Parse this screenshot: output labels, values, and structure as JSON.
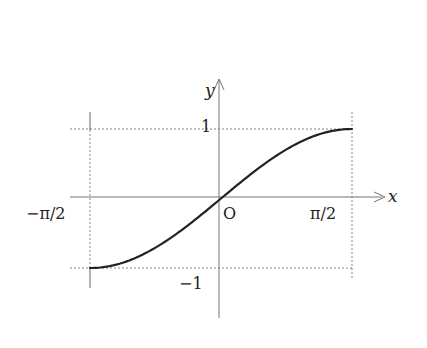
{
  "chart_data": {
    "type": "line",
    "title": "",
    "function": "y = sin x",
    "xlabel": "x",
    "ylabel": "y",
    "xlim": [
      -1.5708,
      1.5708
    ],
    "ylim": [
      -1,
      1
    ],
    "x_ticks": [
      {
        "value": -1.5708,
        "label": "−π/2"
      },
      {
        "value": 1.5708,
        "label": "π/2"
      }
    ],
    "y_ticks": [
      {
        "value": 1,
        "label": "1"
      },
      {
        "value": -1,
        "label": "−1"
      }
    ],
    "origin_label": "O",
    "series": [
      {
        "name": "sin x",
        "x": [
          -1.5708,
          -1.1781,
          -0.7854,
          -0.3927,
          0,
          0.3927,
          0.7854,
          1.1781,
          1.5708
        ],
        "values": [
          -1,
          -0.9239,
          -0.7071,
          -0.3827,
          0,
          0.3827,
          0.7071,
          0.9239,
          1
        ]
      }
    ],
    "grid": false,
    "guide_lines": "dashed lines at y=±1 and x=±π/2"
  },
  "labels": {
    "x_axis": "x",
    "y_axis": "y",
    "origin": "O",
    "x_neg": "−π/2",
    "x_pos": "π/2",
    "y_pos": "1",
    "y_neg": "−1"
  }
}
